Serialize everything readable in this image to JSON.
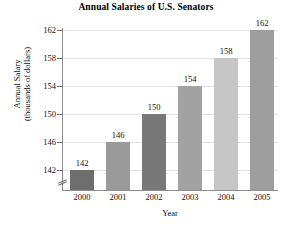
{
  "chart_data": {
    "type": "bar",
    "title": "Annual Salaries of U.S. Senators",
    "xlabel": "Year",
    "ylabel": "Annual Salary\n(thousands of dollars)",
    "ylabel_line1": "Annual Salary",
    "ylabel_line2": "(thousands of dollars)",
    "categories": [
      "2000",
      "2001",
      "2002",
      "2003",
      "2004",
      "2005"
    ],
    "values": [
      142,
      146,
      150,
      154,
      158,
      162
    ],
    "value_labels": [
      "142",
      "146",
      "150",
      "154",
      "158",
      "162"
    ],
    "ylim": [
      140,
      162
    ],
    "yticks": [
      142,
      146,
      150,
      154,
      158,
      162
    ],
    "ytick_labels": [
      "142",
      "146",
      "150",
      "154",
      "158",
      "162"
    ],
    "grid": true,
    "legend": "none",
    "axis_break": true,
    "bar_colors": [
      "#6e6e6e",
      "#9a9a9a",
      "#787878",
      "#a2a2a2",
      "#c6c6c6",
      "#9e9e9e"
    ],
    "grid_color": "#e3e3e3",
    "axis_color": "#8e8e8e"
  }
}
